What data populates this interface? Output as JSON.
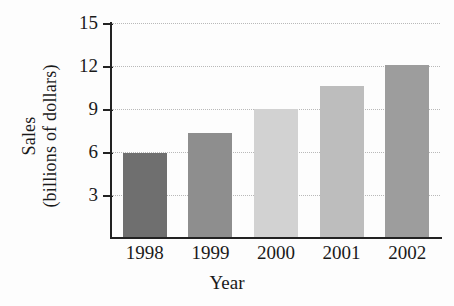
{
  "chart_data": {
    "type": "bar",
    "title": "",
    "subtitle": "",
    "xlabel": "Year",
    "ylabel": "Sales (billions of dollars)",
    "ylabel_line1": "Sales",
    "ylabel_line2": "(billions of dollars)",
    "categories": [
      "1998",
      "1999",
      "2000",
      "2001",
      "2002"
    ],
    "values": [
      5.9,
      7.3,
      9.0,
      10.6,
      12.1
    ],
    "ylim": [
      0,
      15
    ],
    "yticks": [
      3,
      6,
      9,
      12,
      15
    ],
    "ytick_labels": [
      "3",
      "6",
      "9",
      "12",
      "15"
    ],
    "grid": true,
    "grid_style": "dotted-horizontal",
    "legend": false,
    "legend_position": "none",
    "bar_colors": [
      "#6f6f6f",
      "#8e8e8e",
      "#d2d2d2",
      "#bdbdbd",
      "#9d9d9d"
    ],
    "axis_color": "#222222",
    "gridline_color": "#b9b9b9",
    "background_color": "#fdfdfd",
    "bars": [
      {
        "category": "1998",
        "value": 5.9,
        "color": "#6f6f6f"
      },
      {
        "category": "1999",
        "value": 7.3,
        "color": "#8e8e8e"
      },
      {
        "category": "2000",
        "value": 9.0,
        "color": "#d2d2d2"
      },
      {
        "category": "2001",
        "value": 10.6,
        "color": "#bdbdbd"
      },
      {
        "category": "2002",
        "value": 12.1,
        "color": "#9d9d9d"
      }
    ]
  }
}
